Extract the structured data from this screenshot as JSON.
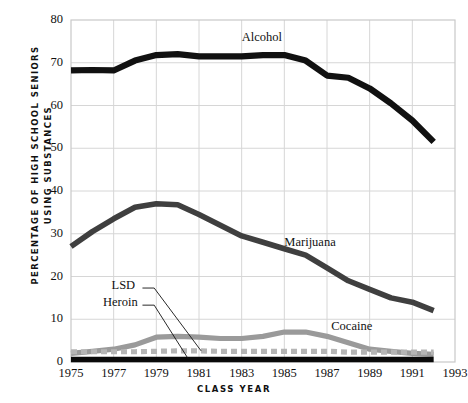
{
  "chart_data": {
    "type": "line",
    "title": "",
    "xlabel": "CLASS YEAR",
    "ylabel": "PERCENTAGE OF HIGH SCHOOL SENIORS USING SUBSTANCES",
    "ylabel_line1": "PERCENTAGE OF HIGH SCHOOL SENIORS",
    "ylabel_line2": "USING SUBSTANCES",
    "xlim": [
      1975,
      1993
    ],
    "ylim": [
      0,
      80
    ],
    "yticks": [
      0,
      10,
      20,
      30,
      40,
      50,
      60,
      70,
      80
    ],
    "xticks": [
      1975,
      1977,
      1979,
      1981,
      1983,
      1985,
      1987,
      1989,
      1991,
      1993
    ],
    "grid": true,
    "legend_position": "inline-annotations",
    "x": [
      1975,
      1976,
      1977,
      1978,
      1979,
      1980,
      1981,
      1982,
      1983,
      1984,
      1985,
      1986,
      1987,
      1988,
      1989,
      1990,
      1991,
      1992
    ],
    "series": [
      {
        "name": "Alcohol",
        "color": "#111111",
        "style": "solid-thick",
        "values": [
          68.2,
          68.3,
          68.2,
          70.5,
          71.8,
          72.0,
          71.5,
          71.5,
          71.5,
          71.8,
          71.8,
          70.5,
          67.0,
          66.5,
          64.0,
          60.5,
          56.5,
          51.5
        ]
      },
      {
        "name": "Marijuana",
        "color": "#3f3f3f",
        "style": "solid-thick",
        "values": [
          27.0,
          30.5,
          33.5,
          36.2,
          37.0,
          36.8,
          34.5,
          32.0,
          29.5,
          28.0,
          26.5,
          25.0,
          22.0,
          19.0,
          17.0,
          15.0,
          14.0,
          12.0
        ]
      },
      {
        "name": "Cocaine",
        "color": "#9a9a9a",
        "style": "solid-thick",
        "values": [
          2.0,
          2.5,
          3.0,
          4.0,
          5.8,
          6.0,
          5.8,
          5.5,
          5.5,
          6.0,
          7.0,
          7.0,
          6.0,
          4.5,
          3.0,
          2.5,
          2.0,
          1.8
        ]
      },
      {
        "name": "LSD",
        "color": "#b5b5b5",
        "style": "dashed-thick",
        "values": [
          2.4,
          2.4,
          2.4,
          2.4,
          2.5,
          2.6,
          2.6,
          2.5,
          2.5,
          2.5,
          2.5,
          2.5,
          2.5,
          2.3,
          2.3,
          2.3,
          2.3,
          2.3
        ]
      },
      {
        "name": "Heroin",
        "color": "#0a0a0a",
        "style": "solid-thick-baseline",
        "values": [
          0.6,
          0.6,
          0.6,
          0.6,
          0.6,
          0.6,
          0.6,
          0.6,
          0.6,
          0.6,
          0.6,
          0.6,
          0.6,
          0.6,
          0.6,
          0.6,
          0.6,
          0.6
        ]
      }
    ],
    "annotations": [
      {
        "text": "Alcohol",
        "x": 1983.0,
        "y": 75.5
      },
      {
        "text": "Marijuana",
        "x": 1985.0,
        "y": 27.5
      },
      {
        "text": "Cocaine",
        "x": 1987.2,
        "y": 8.0
      },
      {
        "text": "LSD",
        "x": 1976.9,
        "y": 17.5
      },
      {
        "text": "Heroin",
        "x": 1976.5,
        "y": 13.5
      }
    ]
  },
  "axis": {
    "y_tick_labels": [
      "80",
      "70",
      "60",
      "50",
      "40",
      "30",
      "20",
      "10",
      "0"
    ],
    "x_tick_labels": [
      "1975",
      "1977",
      "1979",
      "1981",
      "1983",
      "1985",
      "1987",
      "1989",
      "1991",
      "1993"
    ],
    "x_title": "CLASS YEAR",
    "y_title_line1": "PERCENTAGE OF HIGH SCHOOL SENIORS",
    "y_title_line2": "USING SUBSTANCES"
  },
  "labels": {
    "alcohol": "Alcohol",
    "marijuana": "Marijuana",
    "cocaine": "Cocaine",
    "lsd": "LSD",
    "heroin": "Heroin"
  }
}
